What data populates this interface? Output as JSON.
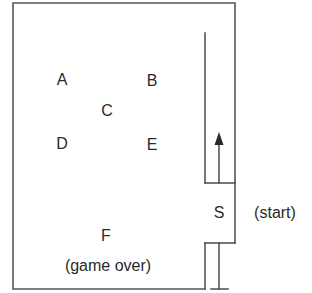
{
  "diagram": {
    "type": "pinball-table-layout",
    "line_color": "#555555",
    "text_color": "#2a2a2a",
    "background": "#ffffff",
    "positions": [
      {
        "id": "A",
        "label": "A",
        "x": 62,
        "y": 80
      },
      {
        "id": "B",
        "label": "B",
        "x": 152,
        "y": 81
      },
      {
        "id": "C",
        "label": "C",
        "x": 107,
        "y": 111
      },
      {
        "id": "D",
        "label": "D",
        "x": 62,
        "y": 144
      },
      {
        "id": "E",
        "label": "E",
        "x": 152,
        "y": 145
      },
      {
        "id": "F",
        "label": "F",
        "x": 106,
        "y": 236
      },
      {
        "id": "S",
        "label": "S",
        "x": 219,
        "y": 213
      }
    ],
    "annotations": {
      "F_note": "(game over)",
      "S_note": "(start)"
    },
    "launch_arrow": {
      "direction": "up"
    }
  }
}
